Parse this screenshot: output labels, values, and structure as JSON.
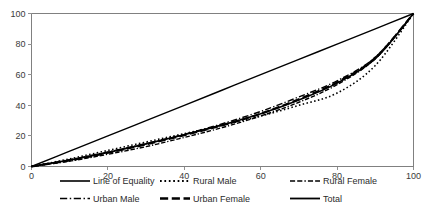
{
  "chart_data": {
    "type": "line",
    "title": "",
    "subtitle": "",
    "xlabel": "",
    "ylabel": "",
    "xlim": [
      0,
      100
    ],
    "ylim": [
      0,
      100
    ],
    "grid": false,
    "legend_position": "bottom",
    "x_ticks": [
      "0",
      "20",
      "40",
      "60",
      "80",
      "100"
    ],
    "x_tick_values": [
      0,
      20,
      40,
      60,
      80,
      100
    ],
    "y_ticks": [
      "0",
      "20",
      "40",
      "60",
      "80",
      "100"
    ],
    "y_tick_values": [
      0,
      20,
      40,
      60,
      80,
      100
    ],
    "x": [
      0,
      10,
      20,
      30,
      40,
      50,
      60,
      70,
      80,
      90,
      100
    ],
    "series": [
      {
        "name": "Line of Equality",
        "style": "solid",
        "width": 1.4,
        "color": "#000000",
        "values": [
          0,
          10,
          20,
          30,
          40,
          50,
          60,
          70,
          80,
          90,
          100
        ]
      },
      {
        "name": "Rural Male",
        "style": "dotted",
        "width": 1.6,
        "color": "#000000",
        "values": [
          0,
          5,
          10.5,
          16,
          21.5,
          27,
          33,
          40,
          48,
          66,
          100
        ]
      },
      {
        "name": "Rural Female",
        "style": "dash-dash-dot",
        "width": 1.4,
        "color": "#000000",
        "values": [
          0,
          3.5,
          8,
          13,
          19,
          25.5,
          33,
          42,
          53.5,
          70.5,
          100
        ]
      },
      {
        "name": "Urban Male",
        "style": "dash-dot",
        "width": 1.4,
        "color": "#000000",
        "values": [
          0,
          4.5,
          9.5,
          15,
          21,
          28,
          36,
          45.5,
          56,
          71.5,
          100
        ]
      },
      {
        "name": "Urban Female",
        "style": "long-dash",
        "width": 2.2,
        "color": "#000000",
        "values": [
          0,
          4,
          9,
          14.5,
          20.5,
          27,
          34.5,
          44,
          55,
          71,
          100
        ]
      },
      {
        "name": "Total",
        "style": "solid",
        "width": 1.6,
        "color": "#000000",
        "values": [
          0,
          4.2,
          9.2,
          14.8,
          20.8,
          27.2,
          34.5,
          43.5,
          54.5,
          70.5,
          100
        ]
      }
    ],
    "legend_entries": [
      {
        "label": "Line of Equality",
        "style": "solid",
        "width": 1.6
      },
      {
        "label": "Rural Male",
        "style": "dotted",
        "width": 1.8
      },
      {
        "label": "Rural Female",
        "style": "dash-dash-dot",
        "width": 1.6
      },
      {
        "label": "Urban Male",
        "style": "dash-dot",
        "width": 1.6
      },
      {
        "label": "Urban Female",
        "style": "long-dash",
        "width": 2.4
      },
      {
        "label": "Total",
        "style": "solid",
        "width": 1.8
      }
    ]
  }
}
